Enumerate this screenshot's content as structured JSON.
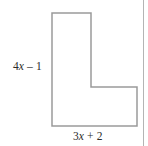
{
  "figure": {
    "name": "l-shaped-polygon",
    "stroke_color": "#9a9a9a",
    "fill_color": "#ffffff",
    "stroke_width": 1.5,
    "vertices": [
      [
        52,
        13
      ],
      [
        91,
        13
      ],
      [
        91,
        87
      ],
      [
        137,
        87
      ],
      [
        137,
        126
      ],
      [
        52,
        126
      ]
    ]
  },
  "labels": {
    "left": {
      "coefficient": "4",
      "variable": "x",
      "operator": "–",
      "constant": "1",
      "full_text": "4x – 1",
      "side": "left-vertical-edge"
    },
    "bottom": {
      "coefficient": "3",
      "variable": "x",
      "operator": "+",
      "constant": "2",
      "full_text": "3x + 2",
      "side": "bottom-horizontal-edge"
    }
  },
  "page_rule": {
    "name": "page-margin-rule",
    "color": "#b4b4b4"
  },
  "canvas": {
    "background": "#ffffff",
    "width": 148,
    "height": 146
  }
}
